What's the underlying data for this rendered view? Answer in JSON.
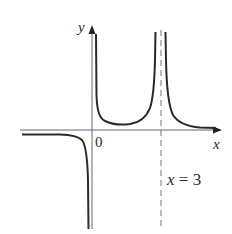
{
  "figure": {
    "type": "function-graph",
    "labels": {
      "y_axis": "y",
      "x_axis": "x",
      "origin": "0",
      "asymptote": "x = 3"
    },
    "features": {
      "vertical_asymptotes": [
        "x = 0",
        "x = 3"
      ],
      "horizontal_asymptote": "y = 0",
      "dashed_asymptote": "x = 3"
    },
    "colors": {
      "curve": "#2a2a2a",
      "axes": "#555555",
      "dashed": "#777777",
      "background": "#ffffff"
    }
  }
}
